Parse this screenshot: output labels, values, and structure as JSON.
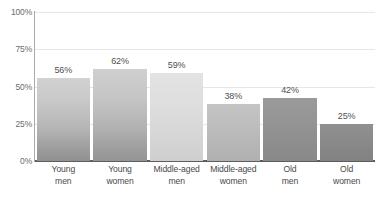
{
  "chart_data": {
    "type": "bar",
    "title": "",
    "subtitle": "",
    "xlabel": "",
    "ylabel": "",
    "ylim": [
      0,
      100
    ],
    "grid": true,
    "legend": "none",
    "orientation": "vertical",
    "categories": [
      "Young men",
      "Young women",
      "Middle-aged men",
      "Middle-aged women",
      "Old men",
      "Old women"
    ],
    "category_lines": [
      [
        "Young",
        "men"
      ],
      [
        "Young",
        "women"
      ],
      [
        "Middle-aged",
        "men"
      ],
      [
        "Middle-aged",
        "women"
      ],
      [
        "Old",
        "men"
      ],
      [
        "Old",
        "women"
      ]
    ],
    "values": [
      56,
      62,
      59,
      38,
      42,
      25
    ],
    "value_labels": [
      "56%",
      "62%",
      "59%",
      "38%",
      "42%",
      "25%"
    ],
    "yticks": [
      100,
      75,
      50,
      25,
      0
    ],
    "ytick_labels": [
      "100%",
      "75%",
      "50%",
      "25%",
      "0%"
    ],
    "bar_colors": [
      "#b4b4b4",
      "#b2b2b2",
      "#dcdcdc",
      "#bdbdbd",
      "#949494",
      "#8b8b8b"
    ],
    "axis_color": "#a9a9a9",
    "baseline_color": "#5d5d5d",
    "gridline_color": "#e6e6e6",
    "text_color": "#4f4f4f",
    "tick_text_color": "#6b6b6b",
    "background": "#ffffff"
  }
}
